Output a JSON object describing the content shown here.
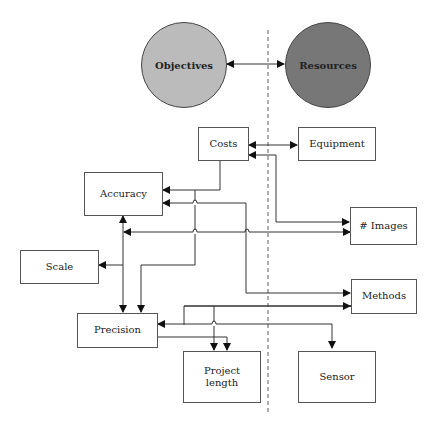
{
  "diagram": {
    "type": "flow",
    "divider": "dashed-vertical",
    "circles": [
      {
        "id": "objectives",
        "label": "Objectives",
        "fill": "#bbbbbb"
      },
      {
        "id": "resources",
        "label": "Resources",
        "fill": "#777777"
      }
    ],
    "nodes": [
      {
        "id": "costs",
        "label": "Costs"
      },
      {
        "id": "equipment",
        "label": "Equipment"
      },
      {
        "id": "accuracy",
        "label": "Accuracy"
      },
      {
        "id": "images",
        "label": "# Images"
      },
      {
        "id": "scale",
        "label": "Scale"
      },
      {
        "id": "methods",
        "label": "Methods"
      },
      {
        "id": "precision",
        "label": "Precision"
      },
      {
        "id": "project_length",
        "label": "Project\nlength",
        "line1": "Project",
        "line2": "length"
      },
      {
        "id": "sensor",
        "label": "Sensor"
      }
    ],
    "edges": [
      {
        "from": "objectives",
        "to": "resources",
        "bidirectional": true
      },
      {
        "from": "costs",
        "to": "equipment",
        "bidirectional": true
      },
      {
        "from": "costs",
        "to": "accuracy"
      },
      {
        "from": "images",
        "to": "costs",
        "bidirectional": true
      },
      {
        "from": "methods",
        "to": "accuracy",
        "bidirectional": true
      },
      {
        "from": "images",
        "to": "accuracy",
        "bidirectional": true
      },
      {
        "from": "accuracy",
        "to": "scale"
      },
      {
        "from": "accuracy",
        "to": "precision"
      },
      {
        "from": "costs",
        "to": "precision"
      },
      {
        "from": "methods",
        "to": "precision"
      },
      {
        "from": "precision",
        "to": "project_length"
      },
      {
        "from": "methods",
        "to": "project_length"
      },
      {
        "from": "precision",
        "to": "sensor"
      }
    ]
  }
}
